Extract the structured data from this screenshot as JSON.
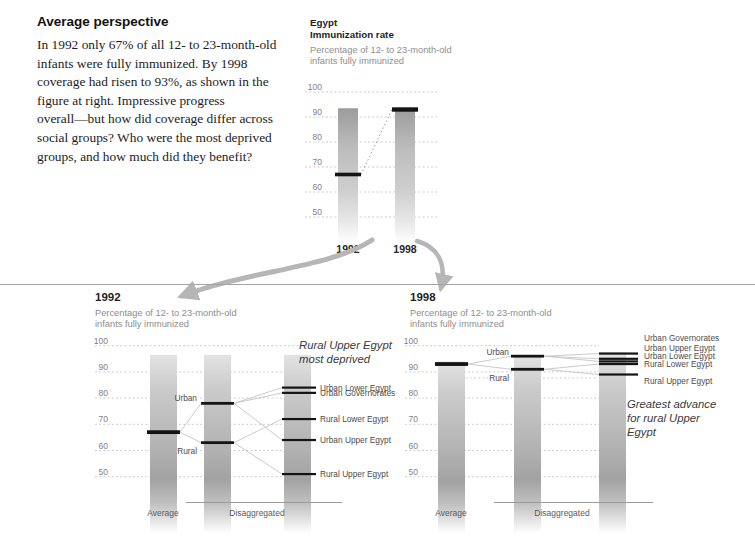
{
  "intro": {
    "title": "Average perspective",
    "body_lines": [
      "In 1992 only 67% of all 12- to 23-month-old",
      "infants were fully immunized. By 1998",
      "coverage had risen to 93%, as shown in the",
      "figure at right. Impressive progress",
      "overall—but how did coverage differ across",
      "social groups? Who were the most deprived",
      "groups, and how much did they benefit?"
    ]
  },
  "colors": {
    "marker": "#141414",
    "gridline": "#c6c6c6",
    "connector": "#cbcbcb",
    "arrow": "#b6b6b6",
    "bar_gray": "#a2a2a2",
    "subtitle_gray": "#8e8e8e",
    "divider": "#a3a3a3"
  },
  "chart_data": [
    {
      "id": "overview",
      "type": "bar",
      "country": "Egypt",
      "title": "Immunization rate",
      "subtitle_lines": [
        "Percentage of 12- to 23-month-old",
        "infants fully immunized"
      ],
      "yticks": [
        100,
        90,
        80,
        70,
        60,
        50
      ],
      "ylim": [
        45,
        100
      ],
      "grid": "dashed",
      "categories": [
        "1992",
        "1998"
      ],
      "values": [
        67,
        93
      ],
      "note": "dotted line connects the 1992 marker to the 1998 marker"
    },
    {
      "id": "detail-1992",
      "type": "bar",
      "title": "1992",
      "subtitle_lines": [
        "Percentage of 12- to 23-month-old",
        "infants fully immunized"
      ],
      "yticks": [
        100,
        90,
        80,
        70,
        60,
        50
      ],
      "ylim": [
        45,
        100
      ],
      "grid": "dashed",
      "x_group_labels": [
        "Average",
        "Disaggregated"
      ],
      "average": {
        "label": "Average",
        "value": 67
      },
      "urban_rural": [
        {
          "label": "Urban",
          "value": 78
        },
        {
          "label": "Rural",
          "value": 63
        }
      ],
      "regions": [
        {
          "label": "Urban Lower Egypt",
          "value": 84,
          "group": "Urban"
        },
        {
          "label": "Urban Governorates",
          "value": 82,
          "group": "Urban"
        },
        {
          "label": "Rural Lower Egypt",
          "value": 72,
          "group": "Rural"
        },
        {
          "label": "Urban Upper Egypt",
          "value": 64,
          "group": "Urban"
        },
        {
          "label": "Rural Upper Egypt",
          "value": 51,
          "group": "Rural"
        }
      ],
      "annotation_lines": [
        "Rural Upper Egypt",
        "most deprived"
      ]
    },
    {
      "id": "detail-1998",
      "type": "bar",
      "title": "1998",
      "subtitle_lines": [
        "Percentage of 12- to 23-month-old",
        "infants fully immunized"
      ],
      "yticks": [
        100,
        90,
        80,
        70,
        60,
        50
      ],
      "ylim": [
        45,
        100
      ],
      "grid": "dashed",
      "x_group_labels": [
        "Average",
        "Disaggregated"
      ],
      "average": {
        "label": "Average",
        "value": 93
      },
      "urban_rural": [
        {
          "label": "Urban",
          "value": 96
        },
        {
          "label": "Rural",
          "value": 91
        }
      ],
      "regions": [
        {
          "label": "Urban Governorates",
          "value": 97,
          "group": "Urban"
        },
        {
          "label": "Urban Upper Egypt",
          "value": 95,
          "group": "Urban"
        },
        {
          "label": "Urban Lower Egypt",
          "value": 94,
          "group": "Urban"
        },
        {
          "label": "Rural Lower Egypt",
          "value": 93,
          "group": "Rural"
        },
        {
          "label": "Rural Upper Egypt",
          "value": 89,
          "group": "Rural"
        }
      ],
      "annotation_lines": [
        "Greatest advance",
        "for rural Upper",
        "Egypt"
      ]
    }
  ]
}
